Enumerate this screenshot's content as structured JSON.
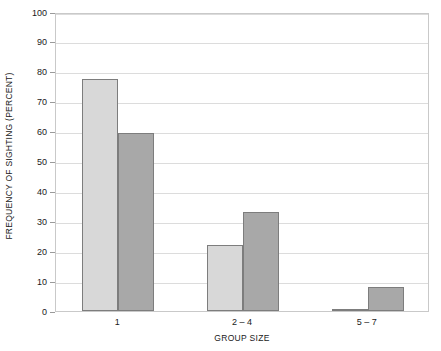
{
  "chart_data": {
    "type": "bar",
    "title": "",
    "subtitle": "",
    "xlabel": "GROUP SIZE",
    "ylabel": "FREQUENCY OF SIGHTING (PERCENT)",
    "categories": [
      "1",
      "2 – 4",
      "5 – 7"
    ],
    "series": [
      {
        "name": "series-a",
        "color": "#d8d8d8",
        "values": [
          77.5,
          22,
          0.5
        ]
      },
      {
        "name": "series-b",
        "color": "#a8a8a8",
        "values": [
          59.5,
          33,
          8
        ]
      }
    ],
    "ylim": [
      0,
      100
    ],
    "ytick_values": [
      0,
      10,
      20,
      30,
      40,
      50,
      60,
      70,
      80,
      90,
      100
    ],
    "ytick_labels": [
      "0",
      "10",
      "20",
      "30",
      "40",
      "50",
      "60",
      "70",
      "80",
      "90",
      "100"
    ],
    "grid": true,
    "grid_axis": "y",
    "legend": false,
    "legend_position": "none",
    "bar_edge_color": "#7d7d7d",
    "grid_color": "#dcdcdc",
    "frame_color": "#c9c9c9"
  }
}
